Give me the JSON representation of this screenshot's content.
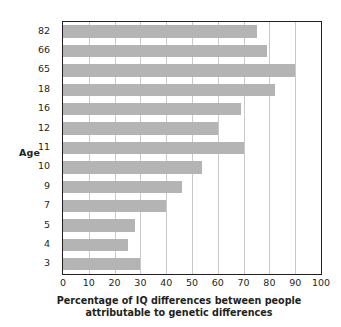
{
  "chart_data": {
    "type": "bar",
    "orientation": "horizontal",
    "title": "",
    "xlabel": "Percentage of IQ differences between people attributable to genetic differences",
    "xlabel_line1": "Percentage of IQ differences between people",
    "xlabel_line2": "attributable to genetic differences",
    "ylabel": "Age",
    "categories": [
      "82",
      "66",
      "65",
      "18",
      "16",
      "12",
      "11",
      "10",
      "9",
      "7",
      "5",
      "4",
      "3"
    ],
    "values": [
      75,
      79,
      90,
      82,
      69,
      60,
      70,
      54,
      46,
      40,
      28,
      25,
      30
    ],
    "xlim": [
      0,
      100
    ],
    "xticks": [
      0,
      10,
      20,
      30,
      40,
      50,
      60,
      70,
      80,
      90,
      100
    ],
    "xtick_labels": [
      "0",
      "10",
      "20",
      "30",
      "40",
      "50",
      "60",
      "70",
      "80",
      "90",
      "100"
    ],
    "grid": "vertical",
    "legend": "none",
    "bar_color": "#b4b4b4",
    "axis_color": "#231f20",
    "gridline_color": "#c9c9c9",
    "background_color": "#ffffff"
  }
}
